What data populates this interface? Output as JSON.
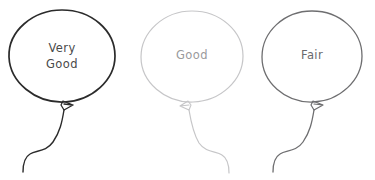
{
  "canvas": {
    "width": 375,
    "height": 180,
    "background": "#ffffff"
  },
  "header": {
    "fragment_1": "———",
    "fragment_2": "————",
    "note": "clipped illegible text at top edge"
  },
  "balloons": [
    {
      "id": "balloon-very-good",
      "label": "Very Good",
      "label_line_1": "Very",
      "label_line_2": "Good",
      "rating": "Very Good",
      "stroke_color": "#2b2b2b",
      "text_color": "#4a4a4a",
      "stroke_width": 1.7,
      "center_x": 62,
      "center_y": 57,
      "radius_x": 53,
      "radius_y": 47,
      "string_direction": "left"
    },
    {
      "id": "balloon-good",
      "label": "Good",
      "label_line_1": "Good",
      "label_line_2": "",
      "rating": "Good",
      "stroke_color": "#c6c6c8",
      "text_color": "#9a9a9c",
      "stroke_width": 1.2,
      "center_x": 192,
      "center_y": 57,
      "radius_x": 51,
      "radius_y": 46,
      "string_direction": "right"
    },
    {
      "id": "balloon-fair",
      "label": "Fair",
      "label_line_1": "Fair",
      "label_line_2": "",
      "rating": "Fair",
      "stroke_color": "#6e6e70",
      "text_color": "#6a6a6c",
      "stroke_width": 1.3,
      "center_x": 312,
      "center_y": 57,
      "radius_x": 50,
      "radius_y": 46,
      "string_direction": "left"
    }
  ]
}
